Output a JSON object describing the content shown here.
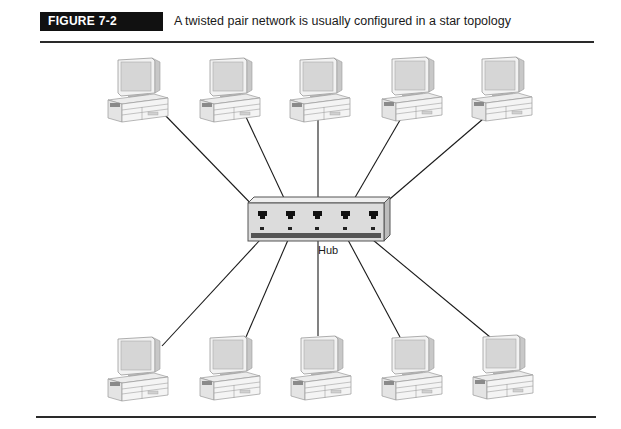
{
  "figure": {
    "label": "FIGURE 7-2",
    "caption": "A twisted pair network is usually configured in a star topology"
  },
  "diagram": {
    "type": "star topology",
    "center": {
      "name": "hub",
      "label": "Hub",
      "ports": 5
    },
    "nodes": [
      {
        "name": "workstation",
        "row": "top",
        "position": 1
      },
      {
        "name": "workstation",
        "row": "top",
        "position": 2
      },
      {
        "name": "workstation",
        "row": "top",
        "position": 3
      },
      {
        "name": "workstation",
        "row": "top",
        "position": 4
      },
      {
        "name": "workstation",
        "row": "top",
        "position": 5
      },
      {
        "name": "workstation",
        "row": "bottom",
        "position": 1
      },
      {
        "name": "workstation",
        "row": "bottom",
        "position": 2
      },
      {
        "name": "workstation",
        "row": "bottom",
        "position": 3
      },
      {
        "name": "workstation",
        "row": "bottom",
        "position": 4
      },
      {
        "name": "workstation",
        "row": "bottom",
        "position": 5
      }
    ],
    "connection_count": 10
  },
  "colors": {
    "label_bg": "#111111",
    "label_text": "#ffffff",
    "hub_face": "#dcdcdc",
    "hub_strip": "#555555",
    "line": "#1a1a1a"
  }
}
